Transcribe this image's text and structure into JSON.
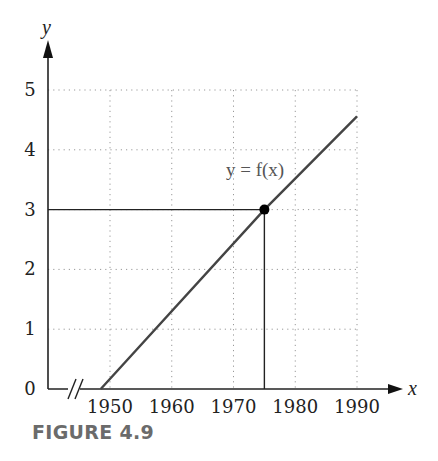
{
  "caption": "FIGURE 4.9",
  "chart_data": {
    "type": "line",
    "title": "",
    "xlabel": "x",
    "ylabel": "y",
    "x_ticks": [
      1950,
      1960,
      1970,
      1980,
      1990
    ],
    "y_ticks": [
      0,
      1,
      2,
      3,
      4,
      5
    ],
    "xlim": [
      1942,
      1997
    ],
    "ylim": [
      0,
      5.5
    ],
    "grid": "dotted",
    "axis_break": "x-axis break (//) between origin and 1950",
    "series": [
      {
        "name": "y = f(x)",
        "points": [
          [
            1948.5,
            0
          ],
          [
            1975,
            3
          ],
          [
            1990,
            4.56
          ]
        ]
      }
    ],
    "annotations": [
      {
        "type": "point",
        "x": 1975,
        "y": 3,
        "marker": "filled-circle"
      },
      {
        "type": "hline",
        "y": 3,
        "from_x": "y-axis",
        "to_x": 1975
      },
      {
        "type": "vline",
        "x": 1975,
        "from_y": 0,
        "to_y": 3
      },
      {
        "type": "label",
        "text": "y = f(x)",
        "x": 1974,
        "y": 3.7
      }
    ]
  }
}
